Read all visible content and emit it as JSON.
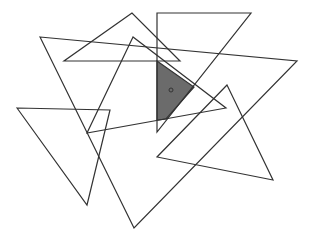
{
  "canvas": {
    "width": 311,
    "height": 239,
    "background": "#ffffff"
  },
  "colors": {
    "stroke": "#333333",
    "shade": "#6b6b6b"
  },
  "triangles": [
    {
      "id": "t1",
      "points": "132,13 64,61 180,61"
    },
    {
      "id": "t2",
      "points": "157,13 251,13 157,132"
    },
    {
      "id": "t3",
      "points": "40,37 297,61 134,228"
    },
    {
      "id": "t4",
      "points": "133,37 87,133 226,108"
    },
    {
      "id": "t5",
      "points": "17,108 110,110 87,205"
    },
    {
      "id": "t6",
      "points": "227,85 157,157 273,180"
    }
  ],
  "shaded_region": {
    "points": "157,61 194,87 166,119 157,120"
  },
  "marker": {
    "cx": 171,
    "cy": 90,
    "r": 2
  }
}
